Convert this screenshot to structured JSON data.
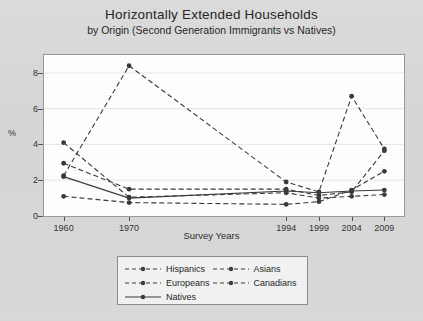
{
  "chart_data": {
    "type": "line",
    "title": "Horizontally Extended Households",
    "subtitle": "by Origin (Second Generation Immigrants vs Natives)",
    "xlabel": "Survey Years",
    "ylabel": "%",
    "categories": [
      "1960",
      "1970",
      "1994",
      "1999",
      "2004",
      "2009"
    ],
    "x_positions": [
      1960,
      1970,
      1994,
      1999,
      2004,
      2009
    ],
    "ylim": [
      0,
      9
    ],
    "yticks": [
      0,
      2,
      4,
      6,
      8
    ],
    "grid": true,
    "legend_position": "bottom",
    "series": [
      {
        "name": "Hispanics",
        "style": "dashed",
        "color": "#3a3a3a",
        "values": [
          2.95,
          1.5,
          1.5,
          1.15,
          1.35,
          3.65
        ]
      },
      {
        "name": "Asians",
        "style": "dashed",
        "color": "#3a3a3a",
        "values": [
          2.25,
          8.4,
          1.9,
          1.35,
          6.7,
          3.75
        ]
      },
      {
        "name": "Europeans",
        "style": "dashed",
        "color": "#3a3a3a",
        "values": [
          4.1,
          1.05,
          1.3,
          1.0,
          1.1,
          1.2
        ]
      },
      {
        "name": "Canadians",
        "style": "dashed",
        "color": "#3a3a3a",
        "values": [
          1.1,
          0.75,
          0.65,
          0.8,
          1.45,
          2.5
        ]
      },
      {
        "name": "Natives",
        "style": "solid",
        "color": "#3a3a3a",
        "values": [
          2.2,
          1.0,
          1.4,
          1.3,
          1.4,
          1.45
        ]
      }
    ]
  },
  "legend": {
    "rows": [
      [
        {
          "label": "Hispanics",
          "style": "dashed"
        },
        {
          "label": "Asians",
          "style": "dashed"
        }
      ],
      [
        {
          "label": "Europeans",
          "style": "dashed"
        },
        {
          "label": "Canadians",
          "style": "dashed"
        }
      ],
      [
        {
          "label": "Natives",
          "style": "solid"
        }
      ]
    ]
  }
}
